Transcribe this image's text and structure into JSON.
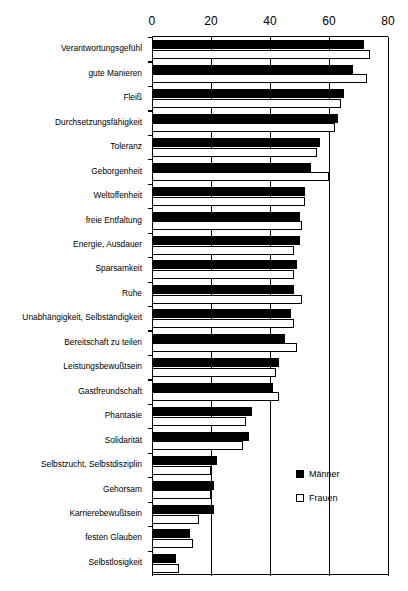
{
  "chart_data": {
    "type": "bar",
    "orientation": "horizontal",
    "title": "",
    "xlabel": "",
    "ylabel": "",
    "xlim": [
      0,
      80
    ],
    "xticks": [
      0,
      20,
      40,
      60,
      80
    ],
    "xtick_labels": [
      "0",
      "20",
      "40",
      "60",
      "80"
    ],
    "grid": true,
    "grid_axis": "x",
    "legend_position": "inside-lower-right",
    "categories": [
      "Verantwortungsgefühl",
      "gute Manieren",
      "Fleiß",
      "Durchsetzungsfähigkeit",
      "Toleranz",
      "Geborgenheit",
      "Weltoffenheit",
      "freie Entfaltung",
      "Energie, Ausdauer",
      "Sparsamkeit",
      "Ruhe",
      "Unabhängigkeit, Selbständigkeit",
      "Bereitschaft zu teilen",
      "Leistungsbewußtsein",
      "Gastfreundschaft",
      "Phantasie",
      "Solidarität",
      "Selbstzucht, Selbstdisziplin",
      "Gehorsam",
      "Karrierebewußtsein",
      "festen Glauben",
      "Selbstlosigkeit"
    ],
    "series": [
      {
        "name": "Männer",
        "style": "filled-black",
        "values": [
          72,
          68,
          65,
          63,
          57,
          54,
          52,
          50,
          50,
          49,
          48,
          47,
          45,
          43,
          41,
          34,
          33,
          22,
          21,
          21,
          13,
          8
        ]
      },
      {
        "name": "Frauen",
        "style": "open-white",
        "values": [
          74,
          73,
          64,
          62,
          56,
          60,
          52,
          51,
          48,
          48,
          51,
          48,
          49,
          42,
          43,
          32,
          31,
          20,
          20,
          16,
          14,
          9
        ]
      }
    ]
  },
  "legend": {
    "items": [
      {
        "label": "Männer",
        "swatch": "filled-square"
      },
      {
        "label": "Frauen",
        "swatch": "open-square"
      }
    ]
  }
}
